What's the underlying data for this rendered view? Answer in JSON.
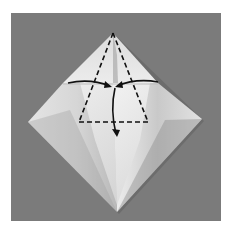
{
  "figure": {
    "type": "origami-fold-diagram",
    "background_color": "#7a7a7a",
    "border_color": "#ffffff",
    "paper_color_light": "#e8e8e8",
    "paper_color_shadow": "#a8a8a8",
    "line_color": "#111111",
    "elements": {
      "paper_shape": "diamond",
      "fold_lines": "dashed triangle",
      "arrows": [
        "left-to-center",
        "right-to-center",
        "center-down"
      ]
    }
  }
}
